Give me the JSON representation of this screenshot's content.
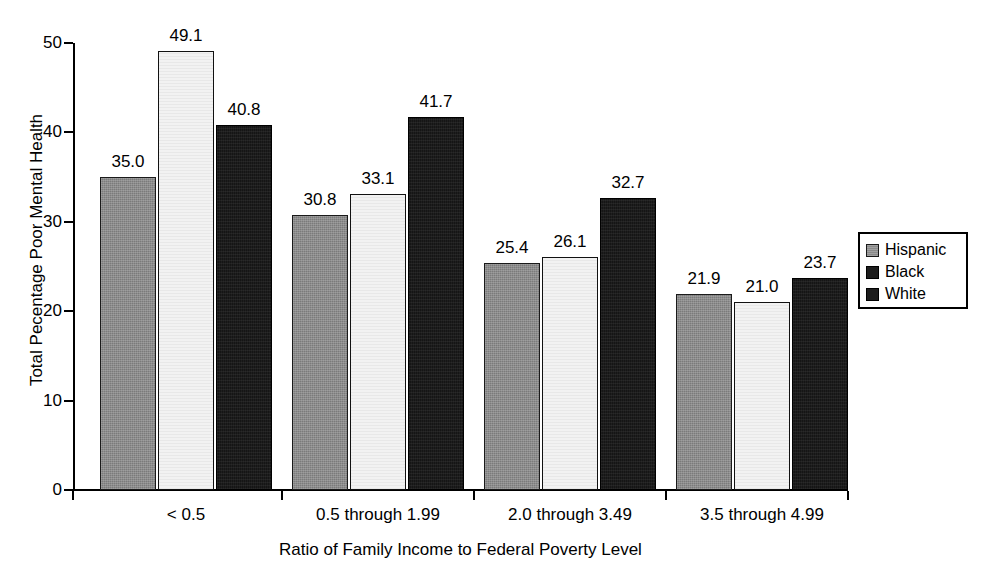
{
  "chart_data": {
    "type": "bar",
    "title": "",
    "xlabel": "Ratio of Family Income to Federal Poverty Level",
    "ylabel": "Total Pecentage Poor Mental Health",
    "categories": [
      "< 0.5",
      "0.5 through 1.99",
      "2.0 through 3.49",
      "3.5 through 4.99"
    ],
    "series": [
      {
        "name": "Hispanic",
        "values": [
          35.0,
          30.8,
          25.4,
          21.9
        ],
        "color": "#7b7b7b"
      },
      {
        "name": "Black",
        "values": [
          49.1,
          33.1,
          26.1,
          21.0
        ],
        "color": "#f2f2f2"
      },
      {
        "name": "White",
        "values": [
          40.8,
          41.7,
          32.7,
          23.7
        ],
        "color": "#151515"
      }
    ],
    "data_labels": [
      [
        "35.0",
        "49.1",
        "40.8"
      ],
      [
        "30.8",
        "33.1",
        "41.7"
      ],
      [
        "25.4",
        "26.1",
        "32.7"
      ],
      [
        "21.9",
        "21.0",
        "23.7"
      ]
    ],
    "ylim": [
      0,
      50
    ],
    "ytick_labels": [
      "0",
      "10",
      "20",
      "30",
      "40",
      "50"
    ],
    "ytick_values": [
      0,
      10,
      20,
      30,
      40,
      50
    ],
    "grid": false,
    "legend_position": "right",
    "legend_entries": [
      "Hispanic",
      "Black",
      "White"
    ]
  },
  "axes": {
    "y_label": "Total Pecentage Poor Mental Health",
    "x_label": "Ratio of Family Income to Federal Poverty Level"
  },
  "legend": {
    "items": [
      {
        "label": "Hispanic",
        "swatch": "swatch-gray"
      },
      {
        "label": "Black",
        "swatch": "swatch-dark"
      },
      {
        "label": "White",
        "swatch": "swatch-dark"
      }
    ]
  }
}
